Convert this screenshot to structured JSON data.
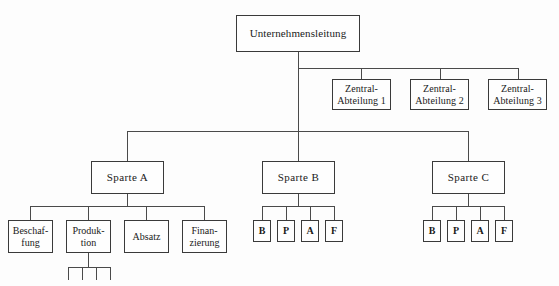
{
  "diagram": {
    "title_text": "Unternehmenslei­tung",
    "type": "organizational-chart",
    "style": {
      "line_color": "#4a4a4a",
      "box_border_color": "#3a3a3a",
      "box_fill": "#fefefe",
      "page_background": "#fdfdfd",
      "text_color": "#1a1a1a"
    },
    "levels": {
      "level_1_label": "Unternehmensleitung",
      "level_2_staff": [
        "Zentral-\nAbteilung 1",
        "Zentral-\nAbteilung 2",
        "Zentral-\nAbteilung 3"
      ],
      "level_3_divisions": [
        "Sparte A",
        "Sparte B",
        "Sparte C"
      ],
      "level_4_sparte_a": [
        "Beschaf-\nfung",
        "Produk-\ntion",
        "Absatz",
        "Finan-\nzierung"
      ],
      "level_4_sparte_b": [
        "B",
        "P",
        "A",
        "F"
      ],
      "level_4_sparte_c": [
        "B",
        "P",
        "A",
        "F"
      ]
    }
  },
  "nodes": {
    "top": "Unternehmensleitung",
    "zentral_1": "Zentral-\nAbteilung 1",
    "zentral_2": "Zentral-\nAbteilung 2",
    "zentral_3": "Zentral-\nAbteilung 3",
    "sparte_a": "Sparte A",
    "sparte_b": "Sparte B",
    "sparte_c": "Sparte C",
    "a_beschaffung": "Beschaf-\nfung",
    "a_produktion": "Produk-\ntion",
    "a_absatz": "Absatz",
    "a_finanzierung": "Finan-\nzierung",
    "b_b": "B",
    "b_p": "P",
    "b_a": "A",
    "b_f": "F",
    "c_b": "B",
    "c_p": "P",
    "c_a": "A",
    "c_f": "F"
  }
}
